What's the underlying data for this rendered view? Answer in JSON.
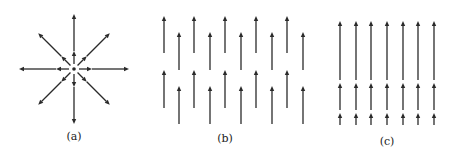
{
  "figure": {
    "panels": [
      {
        "id": "a",
        "label": "(a)",
        "description": "Radial field from a point source: 8 arrows pointing outward from center",
        "center": [
          74,
          69
        ],
        "directions_deg": [
          0,
          45,
          90,
          135,
          180,
          225,
          270,
          315
        ],
        "outer_radius": 55,
        "inner_arrow_radius": 18,
        "label_pos": [
          74,
          140
        ]
      },
      {
        "id": "b",
        "label": "(b)",
        "description": "Uniform upward field: staggered columns of short vertical arrows",
        "columns_x": [
          164,
          179,
          194,
          210,
          225,
          241,
          256,
          272,
          287,
          303
        ],
        "high_rows": [
          [
            53,
            16
          ],
          [
            108,
            70
          ]
        ],
        "low_rows": [
          [
            70,
            32
          ],
          [
            124,
            86
          ]
        ],
        "label_pos": [
          225,
          142
        ]
      },
      {
        "id": "c",
        "label": "(c)",
        "description": "Non-uniform upward field: arrow length increases with height",
        "columns_x": [
          340,
          356,
          371,
          387,
          403,
          418,
          434
        ],
        "rows": [
          [
            80,
            21
          ],
          [
            110,
            83
          ],
          [
            125,
            113
          ]
        ],
        "label_pos": [
          387,
          145
        ]
      }
    ],
    "colors": {
      "ink": "#2a2a2a",
      "background": "#ffffff"
    }
  }
}
